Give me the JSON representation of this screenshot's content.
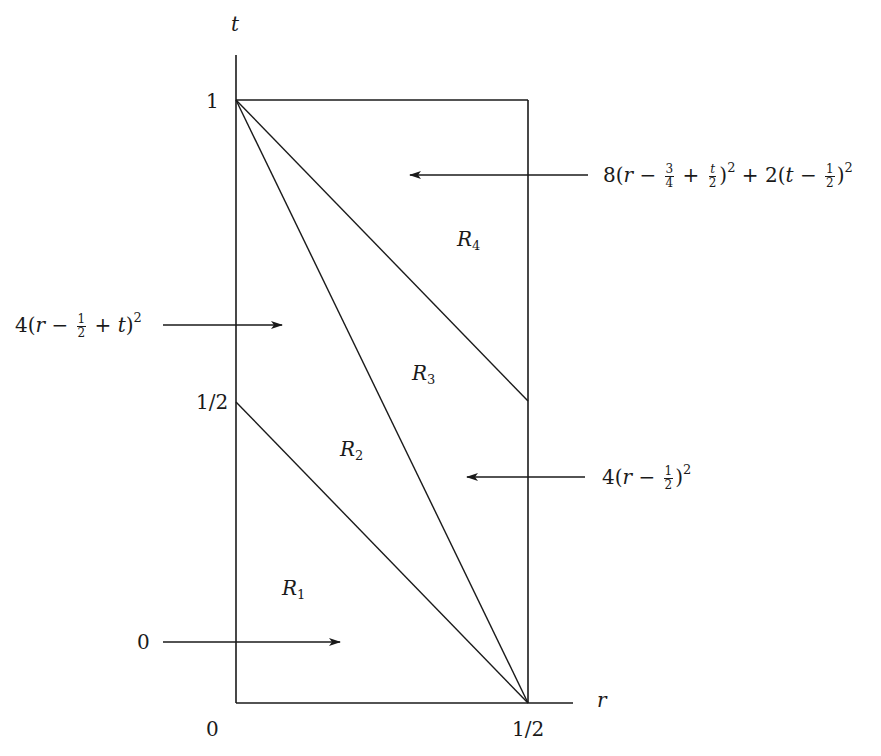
{
  "axes": {
    "t_label": "t",
    "r_label": "r",
    "t_ticks": [
      {
        "label": "1",
        "value": 1
      },
      {
        "label": "1/2",
        "value": 0.5
      }
    ],
    "r_ticks": [
      {
        "label": "0",
        "value": 0
      },
      {
        "label": "1/2",
        "value": 0.5
      }
    ]
  },
  "regions": [
    {
      "name": "R",
      "sub": "1"
    },
    {
      "name": "R",
      "sub": "2"
    },
    {
      "name": "R",
      "sub": "3"
    },
    {
      "name": "R",
      "sub": "4"
    }
  ],
  "annotations": {
    "top_right": {
      "coef1": "8",
      "var1": "r",
      "frac1_num": "3",
      "frac1_den": "4",
      "frac2_num": "t",
      "frac2_den": "2",
      "exp": "2",
      "coef2": "2",
      "var2": "t",
      "frac3_num": "1",
      "frac3_den": "2"
    },
    "mid_left": {
      "coef": "4",
      "var1": "r",
      "frac_num": "1",
      "frac_den": "2",
      "var2": "t",
      "exp": "2"
    },
    "mid_right": {
      "coef": "4",
      "var": "r",
      "frac_num": "1",
      "frac_den": "2",
      "exp": "2"
    },
    "bottom_left": {
      "value": "0"
    }
  },
  "lines": [
    {
      "from": [
        0,
        1
      ],
      "to": [
        0.5,
        0
      ]
    },
    {
      "from": [
        0,
        1
      ],
      "to": [
        0.5,
        0.5
      ]
    },
    {
      "from": [
        0,
        0.5
      ],
      "to": [
        0.5,
        0
      ]
    }
  ],
  "colors": {
    "stroke": "#1a1a1a",
    "background": "#ffffff"
  }
}
